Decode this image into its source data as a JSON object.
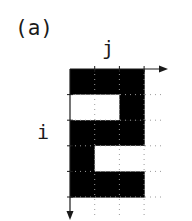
{
  "figure": {
    "panel_label": "(a)",
    "axis_column_label": "j",
    "axis_row_label": "i",
    "grid": {
      "rows": 5,
      "cols": 3,
      "cells": [
        [
          1,
          1,
          1
        ],
        [
          0,
          0,
          1
        ],
        [
          1,
          1,
          1
        ],
        [
          1,
          0,
          0
        ],
        [
          1,
          1,
          1
        ]
      ],
      "filled_color": "#000000",
      "empty_color": "#ffffff",
      "dotted_line_color": "#9a9a9a",
      "axis_color": "#1a1a1a"
    }
  }
}
